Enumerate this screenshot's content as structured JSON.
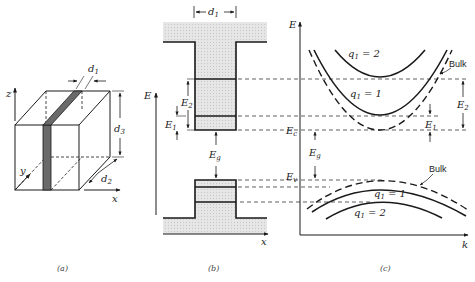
{
  "figure": {
    "panels": [
      {
        "id": "a",
        "caption": "(a)",
        "type": "3d-slab-geometry",
        "axes": {
          "x": "x",
          "y": "y",
          "z": "z"
        },
        "dimensions": {
          "d1": "d",
          "d1_sub": "1",
          "d2": "d",
          "d2_sub": "2",
          "d3": "d",
          "d3_sub": "3"
        }
      },
      {
        "id": "b",
        "caption": "(b)",
        "type": "quantum-well-band-diagram",
        "axes": {
          "vertical": "E",
          "horizontal": "x"
        },
        "labels": {
          "d1": "d",
          "d1_sub": "1",
          "E2": "E",
          "E2_sub": "2",
          "E1": "E",
          "E1_sub": "1",
          "Eg": "E",
          "Eg_sub": "g"
        }
      },
      {
        "id": "c",
        "caption": "(c)",
        "type": "E-k-dispersion",
        "axes": {
          "vertical": "E",
          "horizontal": "k"
        },
        "labels": {
          "Ec": "E",
          "Ec_sub": "c",
          "Ev": "E",
          "Ev_sub": "v",
          "Eg": "E",
          "Eg_sub": "g",
          "E1": "E",
          "E1_sub": "1",
          "E2": "E",
          "E2_sub": "2",
          "bulk_conduction": "Bulk",
          "bulk_valence": "Bulk",
          "cb_q2": "q",
          "cb_q2_tail": " = 2",
          "cb_q1": "q",
          "cb_q1_tail": " = 1",
          "vb_q1": "q",
          "vb_q1_tail": " = 1",
          "vb_q2": "q",
          "vb_q2_tail": " = 2",
          "q_sub": "1"
        }
      }
    ],
    "colors": {
      "line": "#1a1a1a",
      "fill": "#e4e4e4",
      "stripe": "#6a6a6a"
    }
  }
}
